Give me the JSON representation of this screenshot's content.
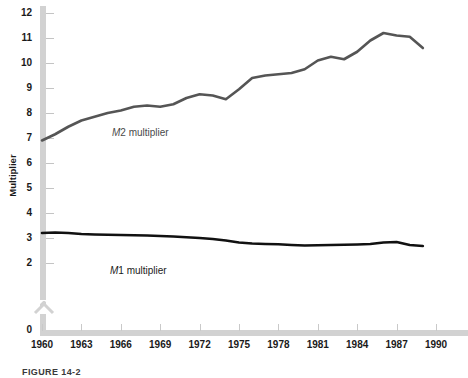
{
  "figure": {
    "caption": "FIGURE 14-2"
  },
  "chart_data": {
    "type": "line",
    "title": "",
    "xlabel": "",
    "ylabel": "Multiplier",
    "xlim": [
      1960,
      1990
    ],
    "ylim": [
      2,
      12
    ],
    "grid": false,
    "legend": "inline-labels",
    "axis_break": "y-axis broken between 0 and 2",
    "x_ticks": [
      1960,
      1963,
      1966,
      1969,
      1972,
      1975,
      1978,
      1981,
      1984,
      1987,
      1990
    ],
    "y_ticks": [
      0,
      2,
      3,
      4,
      5,
      6,
      7,
      8,
      9,
      10,
      11,
      12
    ],
    "series": [
      {
        "name": "M2 multiplier",
        "color": "#555555",
        "x": [
          1960,
          1961,
          1962,
          1963,
          1964,
          1965,
          1966,
          1967,
          1968,
          1969,
          1970,
          1971,
          1972,
          1973,
          1974,
          1975,
          1976,
          1977,
          1978,
          1979,
          1980,
          1981,
          1982,
          1983,
          1984,
          1985,
          1986,
          1987,
          1988,
          1989
        ],
        "values": [
          6.9,
          7.15,
          7.45,
          7.7,
          7.85,
          8.0,
          8.1,
          8.25,
          8.3,
          8.25,
          8.35,
          8.6,
          8.75,
          8.7,
          8.55,
          8.95,
          9.4,
          9.5,
          9.55,
          9.6,
          9.75,
          10.1,
          10.25,
          10.15,
          10.45,
          10.9,
          11.2,
          11.1,
          11.05,
          10.6
        ]
      },
      {
        "name": "M1 multiplier",
        "color": "#111111",
        "x": [
          1960,
          1961,
          1962,
          1963,
          1964,
          1965,
          1966,
          1967,
          1968,
          1969,
          1970,
          1971,
          1972,
          1973,
          1974,
          1975,
          1976,
          1977,
          1978,
          1979,
          1980,
          1981,
          1982,
          1983,
          1984,
          1985,
          1986,
          1987,
          1988,
          1989
        ],
        "values": [
          3.2,
          3.22,
          3.2,
          3.16,
          3.14,
          3.13,
          3.12,
          3.11,
          3.1,
          3.08,
          3.06,
          3.03,
          3.0,
          2.96,
          2.9,
          2.82,
          2.78,
          2.76,
          2.75,
          2.72,
          2.7,
          2.71,
          2.72,
          2.73,
          2.74,
          2.76,
          2.82,
          2.84,
          2.72,
          2.68
        ]
      }
    ],
    "annotations": [
      {
        "name": "m2-label",
        "text": "M2 multiplier"
      },
      {
        "name": "m1-label",
        "text": "M1 multiplier"
      }
    ]
  }
}
